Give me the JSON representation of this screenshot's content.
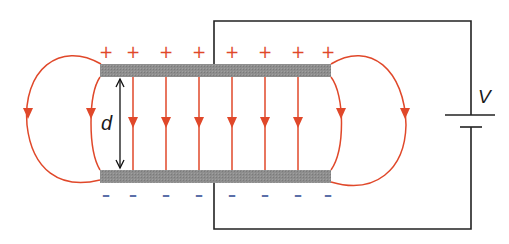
{
  "diagram": {
    "type": "parallel-plate-capacitor-electric-field",
    "labels": {
      "separation": "d",
      "voltage": "V"
    },
    "charges": {
      "top_plate_symbol": "+",
      "bottom_plate_symbol": "–",
      "top_count": 8,
      "bottom_count": 8,
      "top_positions_x": [
        106,
        133,
        166,
        199,
        232,
        265,
        298,
        328
      ],
      "bottom_positions_x": [
        106,
        133,
        166,
        199,
        232,
        265,
        298,
        328
      ]
    },
    "field_lines": {
      "uniform_count": 6,
      "uniform_x": [
        133,
        166,
        199,
        232,
        265,
        298
      ],
      "fringing_loops": 2,
      "direction": "downward (positive to negative)"
    },
    "colors": {
      "field_line": "#e0482a",
      "plus_charge": "#e0482a",
      "minus_charge": "#5b6fa8",
      "plate": "#8c8c8c",
      "wire": "#222222",
      "text": "#1a1a1a"
    },
    "components": [
      "top-plate",
      "bottom-plate",
      "battery",
      "circuit-wire",
      "separation-arrow"
    ]
  }
}
